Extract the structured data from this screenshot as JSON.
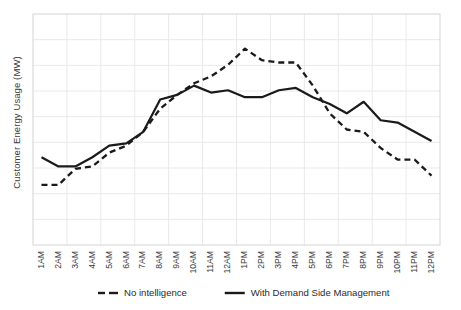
{
  "chart_data": {
    "type": "line",
    "title": "",
    "xlabel": "",
    "ylabel": "Customer Energy Usage (MW)",
    "grid": true,
    "legend_position": "bottom",
    "axis_ticks_visible": false,
    "ylim": [
      0,
      10
    ],
    "categories": [
      "1AM",
      "2AM",
      "3AM",
      "4AM",
      "5AM",
      "6AM",
      "7AM",
      "8AM",
      "9AM",
      "10AM",
      "11AM",
      "12AM",
      "1PM",
      "2PM",
      "3PM",
      "4PM",
      "5PM",
      "6PM",
      "7PM",
      "8PM",
      "9PM",
      "10PM",
      "11PM",
      "12PM"
    ],
    "series": [
      {
        "name": "No intelligence",
        "style": "dashed",
        "color": "#1a1a1a",
        "values": [
          2.6,
          2.6,
          3.3,
          3.4,
          4.0,
          4.3,
          4.9,
          5.9,
          6.5,
          7.0,
          7.3,
          7.8,
          8.5,
          8.0,
          7.9,
          7.9,
          6.9,
          5.7,
          5.0,
          4.9,
          4.2,
          3.7,
          3.7,
          3.0
        ]
      },
      {
        "name": "With Demand Side Management",
        "style": "solid",
        "color": "#1a1a1a",
        "values": [
          3.8,
          3.4,
          3.4,
          3.8,
          4.3,
          4.4,
          4.9,
          6.3,
          6.5,
          6.9,
          6.6,
          6.7,
          6.4,
          6.4,
          6.7,
          6.8,
          6.4,
          6.1,
          5.7,
          6.2,
          5.4,
          5.3,
          4.9,
          4.5
        ]
      }
    ]
  },
  "legend": {
    "items": [
      {
        "label": "No intelligence",
        "style": "dashed"
      },
      {
        "label": "With Demand Side Management",
        "style": "solid"
      }
    ]
  },
  "colors": {
    "line": "#1a1a1a",
    "grid": "#e9e9e9",
    "border": "#d4d4d4",
    "text": "#3b3b3b",
    "background": "#ffffff"
  }
}
